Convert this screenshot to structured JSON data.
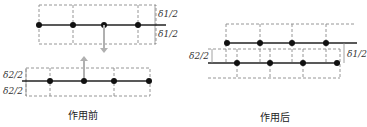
{
  "panels": [
    {
      "id": "before",
      "caption": "作用前",
      "labels": {
        "top_upper": "δ1/2",
        "top_lower": "δ1/2",
        "bottom_upper": "δ2/2",
        "bottom_lower": "δ2/2"
      }
    },
    {
      "id": "after",
      "caption": "作用后",
      "labels": {
        "left": "δ2/2",
        "right": "δ1/2"
      }
    }
  ],
  "colors": {
    "line": "#222222",
    "dot": "#111111",
    "dash": "#8a8a8a",
    "arrow": "#b0b0b0"
  }
}
